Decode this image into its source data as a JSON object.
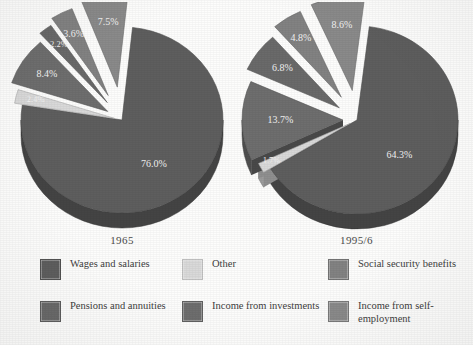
{
  "chart_data": [
    {
      "type": "pie",
      "title": "1965",
      "categories": [
        "Wages and salaries",
        "Income from self-employment",
        "Social security benefits",
        "Pensions and annuities",
        "Income from investments",
        "Other"
      ],
      "values": [
        76.0,
        7.5,
        3.6,
        2.2,
        8.4,
        2.4
      ],
      "labels": [
        "76.0%",
        "7.5%",
        "3.6%",
        "2.2%",
        "8.4%",
        "2.4%"
      ],
      "legend_position": "bottom",
      "exploded": [
        false,
        true,
        true,
        true,
        true,
        true
      ]
    },
    {
      "type": "pie",
      "title": "1995/6",
      "categories": [
        "Wages and salaries",
        "Income from self-employment",
        "Social security benefits",
        "Pensions and annuities",
        "Income from investments",
        "Other"
      ],
      "values": [
        64.3,
        8.6,
        4.8,
        6.8,
        13.7,
        1.7
      ],
      "labels": [
        "64.3%",
        "8.6%",
        "4.8%",
        "6.8%",
        "13.7%",
        "1.7%"
      ],
      "legend_position": "bottom",
      "exploded": [
        false,
        true,
        true,
        true,
        true,
        true
      ]
    }
  ],
  "charts": {
    "left": {
      "year": "1965",
      "slices": [
        {
          "label": "76.0%",
          "value": 76.0,
          "series": "Wages and salaries"
        },
        {
          "label": "7.5%",
          "value": 7.5,
          "series": "Income from self-employment"
        },
        {
          "label": "3.6%",
          "value": 3.6,
          "series": "Social security benefits"
        },
        {
          "label": "2.2%",
          "value": 2.2,
          "series": "Pensions and annuities"
        },
        {
          "label": "8.4%",
          "value": 8.4,
          "series": "Income from investments"
        },
        {
          "label": "2.4%",
          "value": 2.4,
          "series": "Other"
        }
      ]
    },
    "right": {
      "year": "1995/6",
      "slices": [
        {
          "label": "64.3%",
          "value": 64.3,
          "series": "Wages and salaries"
        },
        {
          "label": "8.6%",
          "value": 8.6,
          "series": "Income from self-employment"
        },
        {
          "label": "4.8%",
          "value": 4.8,
          "series": "Social security benefits"
        },
        {
          "label": "6.8%",
          "value": 6.8,
          "series": "Pensions and annuities"
        },
        {
          "label": "13.7%",
          "value": 13.7,
          "series": "Income from investments"
        },
        {
          "label": "1.7%",
          "value": 1.7,
          "series": "Other"
        }
      ]
    }
  },
  "legend": {
    "items": [
      {
        "label": "Wages and salaries",
        "color": "#5e5e5e"
      },
      {
        "label": "Other",
        "color": "#d9d9d9"
      },
      {
        "label": "Social security benefits",
        "color": "#828282"
      },
      {
        "label": "Pensions and annuities",
        "color": "#6a6a6a"
      },
      {
        "label": "Income from investments",
        "color": "#6e6e6e"
      },
      {
        "label": "Income from self-employment",
        "color": "#8a8a8a"
      }
    ]
  },
  "colors": {
    "wages": "#5e5e5e",
    "self_employment": "#8a8a8a",
    "social_security": "#828282",
    "pensions": "#6a6a6a",
    "investments": "#6e6e6e",
    "other": "#d9d9d9",
    "background": "#fdfdfc"
  }
}
